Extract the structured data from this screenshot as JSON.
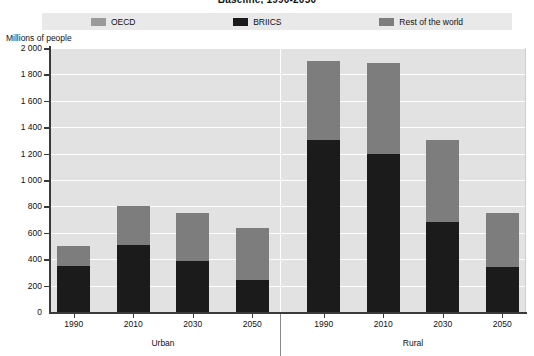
{
  "title": "Baseline, 1990-2050",
  "axis_title": "Millions of people",
  "legend": [
    {
      "label": "OECD",
      "color": "#9a9a9a",
      "icon": "legend-swatch-oecd"
    },
    {
      "label": "BRIICS",
      "color": "#1b1b1b",
      "icon": "legend-swatch-briics"
    },
    {
      "label": "Rest of the world",
      "color": "#7d7d7d",
      "icon": "legend-swatch-rest-of-the-world"
    }
  ],
  "y_ticks": [
    "2 000",
    "1 800",
    "1 600",
    "1 400",
    "1 200",
    "1 000",
    "800",
    "600",
    "400",
    "200",
    "0"
  ],
  "groups": [
    {
      "name": "Urban",
      "label": "Urban"
    },
    {
      "name": "Rural",
      "label": "Rural"
    }
  ],
  "x_labels": [
    "1990",
    "2010",
    "2030",
    "2050",
    "1990",
    "2010",
    "2030",
    "2050"
  ],
  "chart_data": {
    "type": "bar",
    "subtype": "stacked-bar-grouped",
    "title": "Baseline, 1990-2050",
    "xlabel": "",
    "ylabel": "Millions of people",
    "ylim": [
      0,
      2000
    ],
    "ytick_step": 200,
    "grid": true,
    "legend_position": "top",
    "group_field": "settlement",
    "groups": [
      "Urban",
      "Rural"
    ],
    "categories": [
      "1990",
      "2010",
      "2030",
      "2050"
    ],
    "series": [
      {
        "name": "BRIICS",
        "color": "#1b1b1b",
        "stack_order": 0,
        "values": {
          "Urban": [
            350,
            510,
            390,
            240
          ],
          "Rural": [
            1300,
            1200,
            680,
            340
          ]
        }
      },
      {
        "name": "OECD + Rest of the world",
        "color": "#7d7d7d",
        "stack_order": 1,
        "values": {
          "Urban": [
            150,
            290,
            360,
            400
          ],
          "Rural": [
            600,
            690,
            620,
            410
          ]
        }
      }
    ],
    "totals": {
      "Urban": [
        500,
        800,
        750,
        640
      ],
      "Rural": [
        1900,
        1890,
        1300,
        750
      ]
    }
  },
  "bars": [
    {
      "name": "urban-1990",
      "group": "Urban",
      "category": "1990",
      "black": 350,
      "gray": 150,
      "total": 500
    },
    {
      "name": "urban-2010",
      "group": "Urban",
      "category": "2010",
      "black": 510,
      "gray": 290,
      "total": 800
    },
    {
      "name": "urban-2030",
      "group": "Urban",
      "category": "2030",
      "black": 390,
      "gray": 360,
      "total": 750
    },
    {
      "name": "urban-2050",
      "group": "Urban",
      "category": "2050",
      "black": 240,
      "gray": 400,
      "total": 640
    },
    {
      "name": "rural-1990",
      "group": "Rural",
      "category": "1990",
      "black": 1300,
      "gray": 600,
      "total": 1900
    },
    {
      "name": "rural-2010",
      "group": "Rural",
      "category": "2010",
      "black": 1200,
      "gray": 690,
      "total": 1890
    },
    {
      "name": "rural-2030",
      "group": "Rural",
      "category": "2030",
      "black": 680,
      "gray": 620,
      "total": 1300
    },
    {
      "name": "rural-2050",
      "group": "Rural",
      "category": "2050",
      "black": 340,
      "gray": 410,
      "total": 750
    }
  ],
  "colors": {
    "black_series": "#1b1b1b",
    "gray_series": "#7d7d7d",
    "oecd_swatch": "#9a9a9a",
    "plot_background": "#e2e2e2",
    "legend_background": "#e9e9e9",
    "gridline": "#ffffff",
    "axis": "#3a3a3a"
  }
}
